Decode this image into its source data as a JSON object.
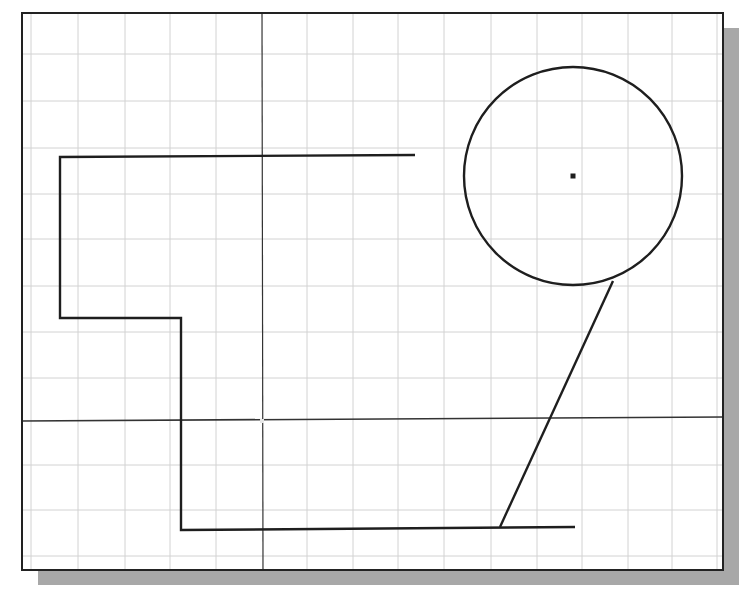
{
  "canvas": {
    "width": 744,
    "height": 601,
    "background": "#ffffff"
  },
  "viewport": {
    "frame": {
      "x1": 22,
      "y1": 13,
      "x2": 723,
      "y2": 570
    },
    "frame_color": "#222222",
    "shadow": {
      "offset_x": 16,
      "offset_y": 15,
      "color": "#a8a8a8"
    }
  },
  "grid": {
    "color": "#d2d2d2",
    "vertical_x": [
      31,
      78,
      125,
      170,
      216,
      307,
      353,
      398,
      444,
      491,
      537,
      582,
      628,
      672,
      717
    ],
    "horizontal_y": [
      54,
      101,
      148,
      194,
      239,
      286,
      332,
      378,
      465,
      510,
      556
    ]
  },
  "crosshair": {
    "color": "#333333",
    "vertical": {
      "x1": 262,
      "y1": 13,
      "x2": 263,
      "y2": 570
    },
    "horizontal": {
      "x1": 22,
      "y1": 421,
      "x2": 723,
      "y2": 417
    },
    "pickbox": {
      "x": 262,
      "y": 421
    }
  },
  "entities": {
    "stroke_color": "#1e1e1e",
    "polyline": {
      "points": [
        [
          415,
          155
        ],
        [
          60,
          157
        ],
        [
          60,
          318
        ],
        [
          181,
          318
        ],
        [
          181,
          530
        ],
        [
          575,
          527
        ]
      ]
    },
    "circle": {
      "cx": 573,
      "cy": 176,
      "r": 109,
      "center_marker_size": 5
    },
    "diagonal_line": {
      "x1": 613,
      "y1": 281,
      "x2": 500,
      "y2": 527
    }
  }
}
